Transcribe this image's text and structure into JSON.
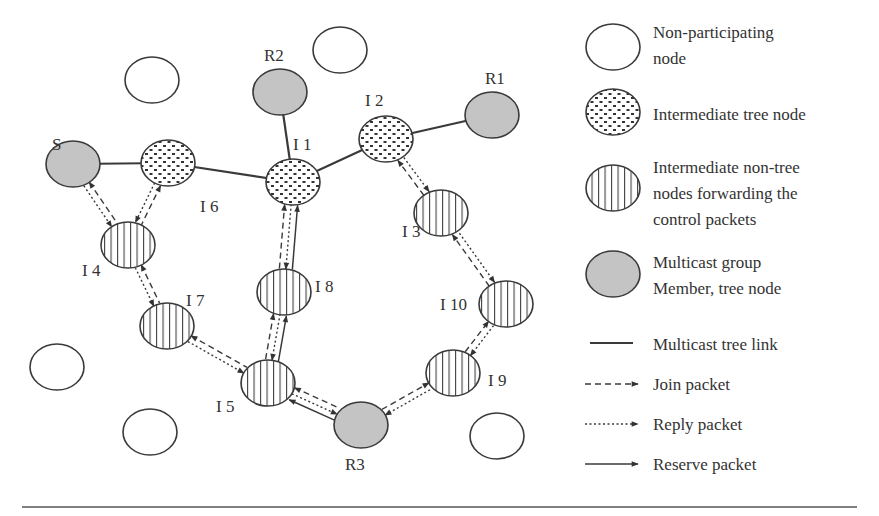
{
  "diagram": {
    "colors": {
      "stroke": "#3a3a3a",
      "member_fill": "#c4c4c4",
      "background": "#ffffff"
    },
    "nodes": [
      {
        "id": "NP1",
        "type": "non-participating",
        "label": "",
        "x": 152,
        "y": 80
      },
      {
        "id": "NP2",
        "type": "non-participating",
        "label": "",
        "x": 340,
        "y": 50
      },
      {
        "id": "NP3",
        "type": "non-participating",
        "label": "",
        "x": 57,
        "y": 367
      },
      {
        "id": "NP4",
        "type": "non-participating",
        "label": "",
        "x": 150,
        "y": 432
      },
      {
        "id": "NP5",
        "type": "non-participating",
        "label": "",
        "x": 497,
        "y": 436
      },
      {
        "id": "S",
        "type": "member",
        "label": "S",
        "x": 73,
        "y": 164
      },
      {
        "id": "R1",
        "type": "member",
        "label": "R1",
        "x": 492,
        "y": 115
      },
      {
        "id": "R2",
        "type": "member",
        "label": "R2",
        "x": 280,
        "y": 92
      },
      {
        "id": "R3",
        "type": "member",
        "label": "R3",
        "x": 361,
        "y": 425
      },
      {
        "id": "I1",
        "type": "tree",
        "label": "I 1",
        "x": 293,
        "y": 182
      },
      {
        "id": "I2",
        "type": "tree",
        "label": "I 2",
        "x": 386,
        "y": 139
      },
      {
        "id": "I6",
        "type": "tree",
        "label": "I 6",
        "x": 168,
        "y": 163
      },
      {
        "id": "I3",
        "type": "non-tree",
        "label": "I 3",
        "x": 441,
        "y": 213
      },
      {
        "id": "I4",
        "type": "non-tree",
        "label": "I 4",
        "x": 128,
        "y": 245
      },
      {
        "id": "I5",
        "type": "non-tree",
        "label": "I 5",
        "x": 268,
        "y": 383
      },
      {
        "id": "I7",
        "type": "non-tree",
        "label": "I 7",
        "x": 167,
        "y": 326
      },
      {
        "id": "I8",
        "type": "non-tree",
        "label": "I 8",
        "x": 284,
        "y": 292
      },
      {
        "id": "I9",
        "type": "non-tree",
        "label": "I 9",
        "x": 453,
        "y": 373
      },
      {
        "id": "I10",
        "type": "non-tree",
        "label": "I 10",
        "x": 506,
        "y": 304
      }
    ],
    "tree_links": [
      [
        "S",
        "I6"
      ],
      [
        "I6",
        "I1"
      ],
      [
        "R2",
        "I1"
      ],
      [
        "I1",
        "I2"
      ],
      [
        "I2",
        "R1"
      ]
    ],
    "packet_paths": [
      {
        "from": "S",
        "to": "I4",
        "join": "to-S",
        "reply": "to-I4"
      },
      {
        "from": "I6",
        "to": "I4",
        "join": "to-I6",
        "reply": "to-I4"
      },
      {
        "from": "I4",
        "to": "I7",
        "join": "to-I4",
        "reply": "to-I7"
      },
      {
        "from": "I7",
        "to": "I5",
        "join": "to-I7",
        "reply": "to-I5"
      },
      {
        "from": "I5",
        "to": "I8",
        "join": "to-I8",
        "reply": "to-I5",
        "reserve": "to-I8"
      },
      {
        "from": "I8",
        "to": "I1",
        "join": "to-I1",
        "reply": "to-I8",
        "reserve": "to-I1"
      },
      {
        "from": "I5",
        "to": "R3",
        "join": "to-I5",
        "reply": "to-R3",
        "reserve": "to-I5"
      },
      {
        "from": "R3",
        "to": "I9",
        "join": "to-I9",
        "reply": "to-R3"
      },
      {
        "from": "I9",
        "to": "I10",
        "join": "to-I10",
        "reply": "to-I9"
      },
      {
        "from": "I10",
        "to": "I3",
        "join": "to-I3",
        "reply": "to-I10"
      },
      {
        "from": "I3",
        "to": "I2",
        "join": "to-I2",
        "reply": "to-I3"
      }
    ]
  },
  "legend": {
    "items": [
      {
        "key": "non-participating",
        "label_lines": [
          "Non-participating",
          "node"
        ]
      },
      {
        "key": "tree",
        "label_lines": [
          "Intermediate tree node"
        ]
      },
      {
        "key": "non-tree",
        "label_lines": [
          "Intermediate non-tree",
          "nodes forwarding the",
          "control packets"
        ]
      },
      {
        "key": "member",
        "label_lines": [
          "Multicast group",
          "Member, tree node"
        ]
      },
      {
        "key": "tree-link",
        "label_lines": [
          "Multicast tree link"
        ]
      },
      {
        "key": "join",
        "label_lines": [
          "Join packet"
        ]
      },
      {
        "key": "reply",
        "label_lines": [
          "Reply packet"
        ]
      },
      {
        "key": "reserve",
        "label_lines": [
          "Reserve packet"
        ]
      }
    ]
  }
}
